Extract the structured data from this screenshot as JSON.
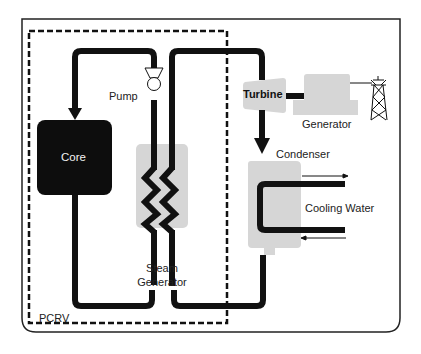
{
  "diagram": {
    "type": "process-flow",
    "colors": {
      "pipe": "#111111",
      "component_fill": "#d9d9d9",
      "core_fill": "#0d0d0d",
      "border": "#222222",
      "background": "#ffffff"
    },
    "labels": {
      "core": "Core",
      "pump": "Pump",
      "steam_generator_line1": "Steam",
      "steam_generator_line2": "Generator",
      "turbine": "Turbine",
      "generator": "Generator",
      "condenser": "Condenser",
      "cooling_water": "Cooling Water",
      "pcrv": "PCRV"
    },
    "nodes": [
      {
        "id": "core",
        "label": "Core"
      },
      {
        "id": "pump",
        "label": "Pump"
      },
      {
        "id": "steam_generator",
        "label": "Steam Generator"
      },
      {
        "id": "turbine",
        "label": "Turbine"
      },
      {
        "id": "generator",
        "label": "Generator"
      },
      {
        "id": "condenser",
        "label": "Condenser"
      },
      {
        "id": "cooling_water",
        "label": "Cooling Water"
      },
      {
        "id": "power_tower",
        "label": ""
      },
      {
        "id": "pcrv",
        "label": "PCRV"
      }
    ],
    "edges": [
      {
        "from": "pump",
        "to": "core"
      },
      {
        "from": "core",
        "to": "steam_generator"
      },
      {
        "from": "steam_generator",
        "to": "pump"
      },
      {
        "from": "steam_generator",
        "to": "turbine"
      },
      {
        "from": "turbine",
        "to": "condenser"
      },
      {
        "from": "condenser",
        "to": "steam_generator"
      },
      {
        "from": "turbine",
        "to": "generator"
      },
      {
        "from": "generator",
        "to": "power_tower"
      }
    ]
  }
}
